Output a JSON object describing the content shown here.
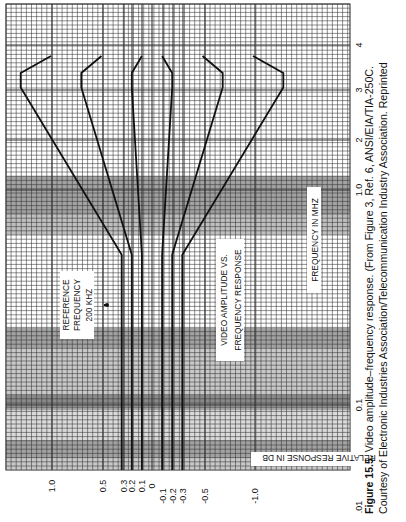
{
  "chart_data": {
    "type": "line",
    "xlabel": "FREQUENCY IN MHZ",
    "ylabel": "RELATIVE RESPONSE IN DB",
    "x_scale": "log",
    "xlim": [
      0.01,
      4.2
    ],
    "ylim": [
      -1.4,
      1.4
    ],
    "x_ticks": [
      ".01",
      "0.1",
      "1.0",
      "2",
      "3",
      "4"
    ],
    "y_ticks": [
      "1.0",
      "0.5",
      "0.3",
      "0.2",
      "0.1",
      "0",
      "-0.1",
      "-0.2",
      "-0.3",
      "-0.5",
      "-1.0"
    ],
    "annotation": {
      "text": [
        "REFERENCE",
        "FREQUENCY",
        "200 KHZ"
      ],
      "x": 0.2
    },
    "orientation": "rotated 90 degrees counter-clockwise",
    "series": [
      {
        "name": "limit +0.3/+1.0",
        "x": [
          0.01,
          0.5,
          3.0,
          3.5,
          4.2
        ],
        "values": [
          0.3,
          0.3,
          1.3,
          1.3,
          1.0
        ]
      },
      {
        "name": "limit +0.2/+0.5",
        "x": [
          0.01,
          0.5,
          3.0,
          3.5,
          4.2
        ],
        "values": [
          0.2,
          0.2,
          0.7,
          0.7,
          0.5
        ]
      },
      {
        "name": "limit +0.1/+0.1",
        "x": [
          0.01,
          0.5,
          3.0,
          3.5,
          4.2
        ],
        "values": [
          0.1,
          0.1,
          0.2,
          0.2,
          0.1
        ]
      },
      {
        "name": "limit -0.1/-0.1",
        "x": [
          0.01,
          0.5,
          3.0,
          3.5,
          4.2
        ],
        "values": [
          -0.1,
          -0.1,
          -0.2,
          -0.2,
          -0.1
        ]
      },
      {
        "name": "limit -0.2/-0.5",
        "x": [
          0.01,
          0.5,
          3.0,
          3.5,
          4.2
        ],
        "values": [
          -0.2,
          -0.2,
          -0.7,
          -0.7,
          -0.5
        ]
      },
      {
        "name": "limit -0.3/-1.0",
        "x": [
          0.01,
          0.5,
          3.0,
          3.5,
          4.2
        ],
        "values": [
          -0.3,
          -0.3,
          -1.3,
          -1.3,
          -1.0
        ]
      }
    ],
    "grid": true
  },
  "caption": {
    "label": "Figure 15.5.",
    "line1": " Video amplitude–frequency response. (From Figure 3, Ref. 6, ANSI/EIA/TIA-250C.",
    "line2": "Courtesy of Electronic Industries Association/Telecommunication Industry Association. Reprinted"
  }
}
